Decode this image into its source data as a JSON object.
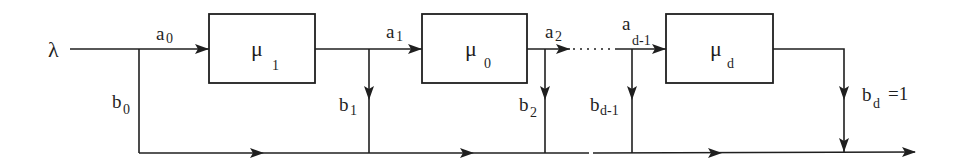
{
  "diagram": {
    "type": "queueing-flow-diagram",
    "input": {
      "symbol": "λ"
    },
    "stations": [
      {
        "id": "box1",
        "symbol": "μ",
        "subscript": "1"
      },
      {
        "id": "box2",
        "symbol": "μ",
        "subscript": "0"
      },
      {
        "id": "box3",
        "symbol": "μ",
        "subscript": "d"
      }
    ],
    "forward_flows": [
      {
        "base": "a",
        "subscript": "0"
      },
      {
        "base": "a",
        "subscript": "1"
      },
      {
        "base": "a",
        "subscript": "2"
      },
      {
        "base": "a",
        "subscript": "d-1"
      }
    ],
    "branch_flows": [
      {
        "base": "b",
        "subscript": "0"
      },
      {
        "base": "b",
        "subscript": "1"
      },
      {
        "base": "b",
        "subscript": "2"
      },
      {
        "base": "b",
        "subscript": "d-1"
      },
      {
        "base": "b",
        "subscript": "d",
        "suffix": "=1"
      }
    ],
    "colors": {
      "stroke": "#1f1f1f",
      "background": "#ffffff"
    }
  }
}
